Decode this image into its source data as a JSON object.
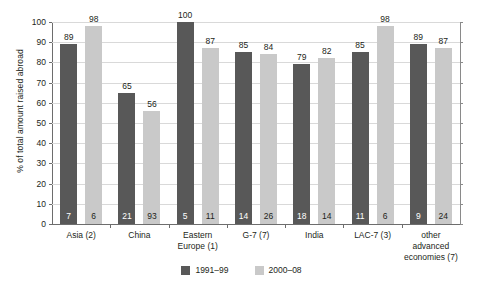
{
  "chart_data": {
    "type": "bar",
    "title": "",
    "subtitle": "",
    "xlabel": "",
    "ylabel": "% of total amount raised abroad",
    "ylim": [
      0,
      100
    ],
    "yticks": [
      0,
      10,
      20,
      30,
      40,
      50,
      60,
      70,
      80,
      90,
      100
    ],
    "grid": true,
    "legend_position": "bottom-center",
    "categories": [
      "Asia (2)",
      "China",
      "Eastern Europe (1)",
      "G-7 (7)",
      "India",
      "LAC-7 (3)",
      "other advanced economies (7)"
    ],
    "series": [
      {
        "name": "1991–99",
        "color": "#585858",
        "values": [
          89,
          65,
          100,
          85,
          79,
          85,
          89
        ],
        "inner_values": [
          7,
          21,
          5,
          14,
          18,
          11,
          9
        ]
      },
      {
        "name": "2000–08",
        "color": "#c9c9c9",
        "values": [
          98,
          56,
          87,
          84,
          82,
          98,
          87
        ],
        "inner_values": [
          6,
          93,
          11,
          26,
          14,
          6,
          24
        ]
      }
    ]
  },
  "axis": {
    "y_title": "% of total amount raised abroad",
    "y_tick_labels": [
      "0",
      "10",
      "20",
      "30",
      "40",
      "50",
      "60",
      "70",
      "80",
      "90",
      "100"
    ],
    "x_tick_labels": [
      [
        "Asia (2)"
      ],
      [
        "China"
      ],
      [
        "Eastern",
        "Europe (1)"
      ],
      [
        "G-7 (7)"
      ],
      [
        "India"
      ],
      [
        "LAC-7 (3)"
      ],
      [
        "other",
        "advanced",
        "economies (7)"
      ]
    ]
  },
  "legend": {
    "items": [
      {
        "label": "1991–99",
        "color": "#585858"
      },
      {
        "label": "2000–08",
        "color": "#c9c9c9"
      }
    ]
  },
  "colors": {
    "series_1991_99": "#585858",
    "series_2000_08": "#c9c9c9",
    "gridline": "#d9d9d9",
    "axis": "#6d6d6d",
    "text": "#231f20",
    "background": "#ffffff"
  }
}
